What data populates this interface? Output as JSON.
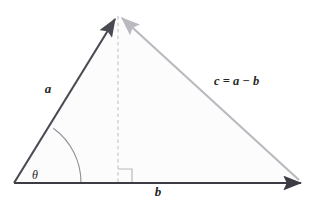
{
  "figure": {
    "kind": "vector-subtraction-triangle-diagram",
    "background_color": "#ffffff",
    "width": 313,
    "height": 204
  },
  "colors": {
    "vector_a_stroke": "#4a4a52",
    "vector_b_stroke": "#3c3c44",
    "vector_c_stroke": "#b9b9bf",
    "dashed_altitude_stroke": "#c9c9cf",
    "right_angle_stroke": "#b9b9bf",
    "angle_arc_stroke": "#8f8f97",
    "triangle_fill": "#fcfcfd",
    "label_color": "#262626"
  },
  "labels": {
    "vector_a": "a",
    "vector_b": "b",
    "vector_c_full": "c = a − b",
    "vector_c_lhs": "c",
    "vector_c_equals": "=",
    "vector_c_term1": "a",
    "vector_c_minus": "−",
    "vector_c_term2": "b",
    "angle_theta": "θ"
  },
  "geometry": {
    "origin": {
      "x": 14,
      "y": 183
    },
    "apex": {
      "x": 118,
      "y": 14
    },
    "baseline_end": {
      "x": 303,
      "y": 183
    },
    "altitude_foot": {
      "x": 118,
      "y": 183
    },
    "angle_arc_radius": 67,
    "right_angle_size": 14
  },
  "label_positions": {
    "vector_a": {
      "x": 48,
      "y": 93
    },
    "vector_b": {
      "x": 158,
      "y": 196
    },
    "vector_c": {
      "x": 214,
      "y": 85
    },
    "angle_theta": {
      "x": 35,
      "y": 179
    }
  },
  "elements": {
    "vector_a_name": "vector-a-arrow",
    "vector_b_name": "vector-b-arrow",
    "vector_c_name": "vector-c-arrow",
    "altitude_name": "dashed-altitude-line",
    "right_angle_name": "right-angle-marker",
    "angle_arc_name": "theta-angle-arc"
  }
}
